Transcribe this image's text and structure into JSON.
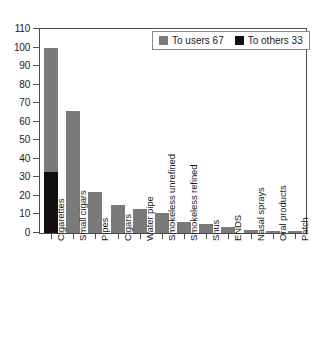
{
  "chart_data": {
    "type": "bar",
    "stacked": true,
    "title": "",
    "xlabel": "",
    "ylabel": "",
    "ylim": [
      0,
      110
    ],
    "ytick_step": 10,
    "yticks": [
      0,
      10,
      20,
      30,
      40,
      50,
      60,
      70,
      80,
      90,
      100,
      110
    ],
    "grid": false,
    "legend_position": "top-right",
    "categories": [
      "Cigarettes",
      "Small cigars",
      "Pipes",
      "Cigars",
      "Water pipe",
      "Smokeless unrefined",
      "Smokeless refined",
      "Snus",
      "ENDS",
      "Nasal sprays",
      "Oral products",
      "Patch"
    ],
    "series": [
      {
        "name": "To users 67",
        "color": "#7a7a7a",
        "values": [
          67,
          66,
          22,
          15,
          13,
          11,
          6,
          5,
          3,
          1.5,
          1,
          1
        ]
      },
      {
        "name": "To others 33",
        "color": "#111111",
        "values": [
          33,
          0,
          0,
          0,
          0,
          0,
          0,
          0,
          0,
          0,
          0,
          0
        ]
      }
    ],
    "totals": [
      100,
      66,
      22,
      15,
      13,
      11,
      6,
      5,
      3,
      1.5,
      1,
      1
    ]
  },
  "legend": {
    "entries": [
      {
        "label": "To users 67",
        "color": "#7a7a7a"
      },
      {
        "label": "To others 33",
        "color": "#111111"
      }
    ]
  },
  "colors": {
    "users": "#7a7a7a",
    "others": "#111111",
    "axis": "#4d4d4d",
    "text": "#1a1a1a",
    "background": "#ffffff"
  }
}
